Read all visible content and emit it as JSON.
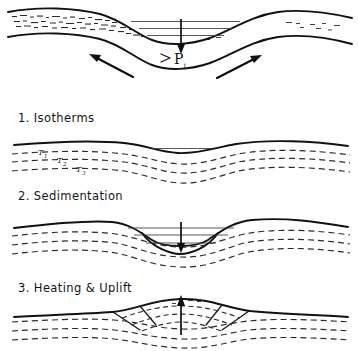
{
  "figure": {
    "background_color": "#ffffff",
    "ink_color": "#111111",
    "dashed_line_color": "#2b2b2b",
    "width": 358,
    "height": 351
  },
  "panels": [
    {
      "id": "panel-extension",
      "caption": "",
      "order": 0,
      "description": "Crustal extension and subsidence",
      "labels": {
        "pressure": "P",
        "pressure_subscript": "1"
      },
      "arrows": [
        {
          "name": "extension-arrow-left",
          "direction": "up-left"
        },
        {
          "name": "extension-arrow-right",
          "direction": "up-right"
        },
        {
          "name": "subsidence-arrow",
          "direction": "down"
        }
      ]
    },
    {
      "id": "panel-isotherms",
      "caption": "1. Isotherms",
      "order": 1,
      "description": "Isotherm surfaces beneath thinned crust",
      "isotherm_labels": [
        {
          "symbol": "T",
          "subscript": "1"
        },
        {
          "symbol": "T",
          "subscript": "2"
        },
        {
          "symbol": "T",
          "subscript": "3"
        }
      ]
    },
    {
      "id": "panel-sedimentation",
      "caption": "2. Sedimentation",
      "order": 2,
      "description": "Basin infilled with sediment layers, continued subsidence",
      "arrows": [
        {
          "name": "subsidence-arrow",
          "direction": "down"
        }
      ]
    },
    {
      "id": "panel-heating-uplift",
      "caption": "3. Heating & Uplift",
      "order": 3,
      "description": "Thermal re-equilibration arches isotherms and uplifts basin",
      "arrows": [
        {
          "name": "uplift-arrow",
          "direction": "up"
        }
      ]
    }
  ]
}
